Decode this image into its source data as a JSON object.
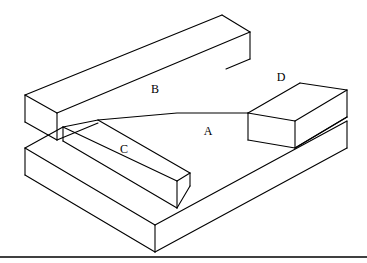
{
  "figure": {
    "background_color": "#ffffff",
    "line_color": "#000000",
    "ground_line": {
      "name": "ground-line",
      "y": 257,
      "x_start": 0,
      "x_end": 367
    },
    "labels": [
      {
        "id": "A",
        "text": "A",
        "x": 208,
        "y": 132,
        "surface": "main-top-face"
      },
      {
        "id": "B",
        "text": "B",
        "x": 155,
        "y": 90,
        "surface": "back-wall-top-face"
      },
      {
        "id": "C",
        "text": "C",
        "x": 124,
        "y": 150,
        "surface": "front-left-bar-top-face"
      },
      {
        "id": "D",
        "text": "D",
        "x": 281,
        "y": 78,
        "surface": "right-rear-bar-top-face"
      }
    ],
    "geometry": {
      "main_top_face": "116,148 177,113 248,113 300,83 347,90 293,124 177,194",
      "back_wall_top_face": "25,95 222,15 250,32 57,113",
      "back_wall_front_face": "57,113 250,32 250,59 250,59 57,139",
      "left_end_face": "25,95 57,113 57,139 25,135",
      "right_rear_bar_top": "248,113 300,83 347,90 295,121",
      "right_rear_bar_front": "248,113 295,121 295,147 248,139",
      "right_rear_bar_right": "295,121 347,90 347,117 295,147",
      "front_left_bar_top": "63,141 98,120 142,127 107,148 116,148 177,194 177,167",
      "front_left_bar_front": "116,175 177,194 177,221 116,202",
      "front_left_bar_right": "177,194 177,221",
      "base_front_left": "25,175 155,252 155,225 25,148",
      "base_front_right": "155,252 347,148 347,121 155,225"
    }
  }
}
